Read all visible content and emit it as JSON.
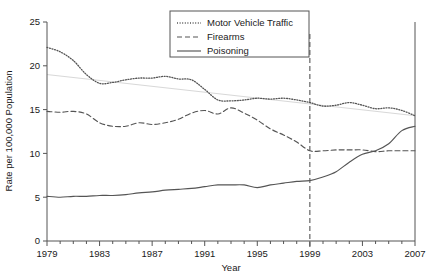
{
  "chart_data": {
    "type": "line",
    "title": "",
    "xlabel": "Year",
    "ylabel": "Rate per 100,000 Population",
    "xlim": [
      1979,
      2007
    ],
    "ylim": [
      0,
      25
    ],
    "yticks": [
      0,
      5,
      10,
      15,
      20,
      25
    ],
    "xticks_major": [
      1979,
      1983,
      1987,
      1991,
      1995,
      1999,
      2003,
      2007
    ],
    "xticks_minor_step": 1,
    "grid": false,
    "legend_position": "top-right",
    "x": [
      1979,
      1980,
      1981,
      1982,
      1983,
      1984,
      1985,
      1986,
      1987,
      1988,
      1989,
      1990,
      1991,
      1992,
      1993,
      1994,
      1995,
      1996,
      1997,
      1998,
      1999,
      2000,
      2001,
      2002,
      2003,
      2004,
      2005,
      2006,
      2007
    ],
    "series": [
      {
        "name": "Motor Vehicle Traffic",
        "style": "dotted",
        "color": "#555555",
        "values": [
          22.1,
          21.6,
          20.6,
          19.0,
          18.0,
          18.1,
          18.4,
          18.6,
          18.6,
          18.8,
          18.5,
          18.4,
          17.3,
          16.1,
          16.0,
          16.1,
          16.3,
          16.2,
          16.3,
          16.1,
          15.8,
          15.4,
          15.5,
          15.8,
          15.5,
          15.1,
          15.2,
          14.9,
          14.3
        ]
      },
      {
        "name": "Firearms",
        "style": "dashed",
        "color": "#555555",
        "values": [
          14.8,
          14.7,
          14.8,
          14.5,
          13.5,
          13.1,
          13.1,
          13.5,
          13.3,
          13.5,
          13.9,
          14.6,
          14.9,
          14.5,
          15.2,
          14.6,
          13.8,
          12.8,
          12.1,
          11.3,
          10.3,
          10.3,
          10.4,
          10.4,
          10.4,
          10.2,
          10.3,
          10.3,
          10.3
        ]
      },
      {
        "name": "Poisoning",
        "style": "solid",
        "color": "#555555",
        "values": [
          5.1,
          5.0,
          5.1,
          5.1,
          5.2,
          5.2,
          5.3,
          5.5,
          5.6,
          5.8,
          5.9,
          6.0,
          6.2,
          6.4,
          6.4,
          6.4,
          6.1,
          6.4,
          6.6,
          6.8,
          6.9,
          7.3,
          7.9,
          9.0,
          9.9,
          10.3,
          11.1,
          12.6,
          13.1
        ]
      }
    ],
    "trend_line": {
      "name": "motor-vehicle-trend",
      "color": "#d8d8d8",
      "x": [
        1979,
        2007
      ],
      "values": [
        19.0,
        14.3
      ]
    },
    "reference_line": {
      "name": "year-1999-marker",
      "x": 1999,
      "style": "dashed",
      "color": "#555555"
    }
  },
  "legend": {
    "items": [
      {
        "label": "Motor Vehicle Traffic"
      },
      {
        "label": "Firearms"
      },
      {
        "label": "Poisoning"
      }
    ]
  }
}
